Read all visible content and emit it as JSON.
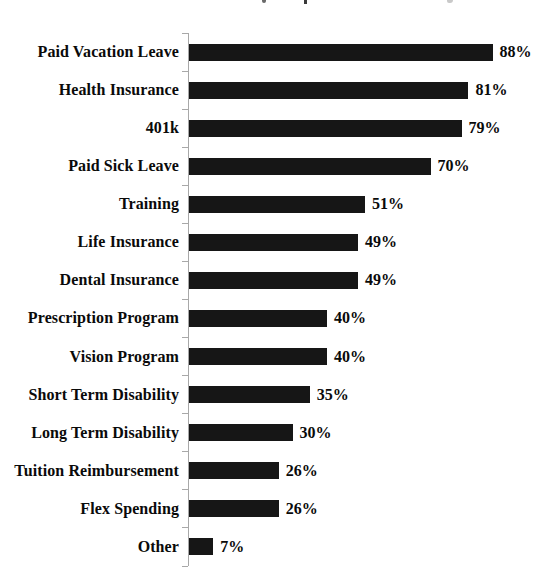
{
  "chart_data": {
    "type": "bar",
    "orientation": "horizontal",
    "title": "",
    "categories": [
      "Paid Vacation Leave",
      "Health Insurance",
      "401k",
      "Paid Sick Leave",
      "Training",
      "Life Insurance",
      "Dental Insurance",
      "Prescription Program",
      "Vision Program",
      "Short Term Disability",
      "Long Term Disability",
      "Tuition Reimbursement",
      "Flex Spending",
      "Other"
    ],
    "values": [
      88,
      81,
      79,
      70,
      51,
      49,
      49,
      40,
      40,
      35,
      30,
      26,
      26,
      7
    ],
    "value_labels": [
      "88%",
      "81%",
      "79%",
      "70%",
      "51%",
      "49%",
      "49%",
      "40%",
      "40%",
      "35%",
      "30%",
      "26%",
      "26%",
      "7%"
    ],
    "value_suffix": "%",
    "xlim": [
      0,
      100
    ],
    "grid": false,
    "legend": false,
    "data_labels_position": "end-of-bar",
    "colors": {
      "bar": "#161616",
      "text": "#0a0a0a",
      "axis": "#a8a8a8",
      "background": "#ffffff"
    }
  }
}
